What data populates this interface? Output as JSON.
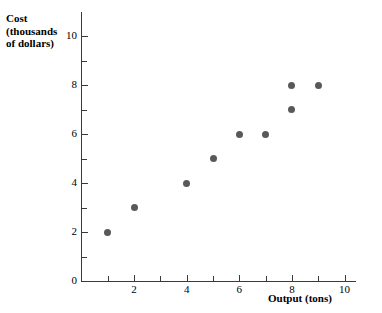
{
  "chart_data": {
    "type": "scatter",
    "title": "",
    "ylabel_lines": [
      "Cost",
      "(thousands",
      "of dollars)"
    ],
    "ylabel": "Cost (thousands of dollars)",
    "xlabel": "Output (tons)",
    "xlim": [
      0,
      10.45
    ],
    "ylim": [
      0,
      11
    ],
    "grid": false,
    "legend": null,
    "x_major_ticks": [
      0,
      2,
      4,
      6,
      8,
      10
    ],
    "x_minor_ticks": [
      1,
      3,
      5,
      7,
      9
    ],
    "x_tick_labels": [
      "0",
      "2",
      "4",
      "6",
      "8",
      "10"
    ],
    "y_major_ticks": [
      0,
      2,
      4,
      6,
      8,
      10
    ],
    "y_minor_ticks": [
      1,
      3,
      5,
      7,
      9
    ],
    "y_tick_labels": [
      "0",
      "2",
      "4",
      "6",
      "8",
      "10"
    ],
    "marker_color": "#595959",
    "axis_color": "#3a3a3a",
    "points": [
      {
        "x": 1,
        "y": 2
      },
      {
        "x": 2,
        "y": 3
      },
      {
        "x": 4,
        "y": 4
      },
      {
        "x": 5,
        "y": 5
      },
      {
        "x": 6,
        "y": 6
      },
      {
        "x": 7,
        "y": 6
      },
      {
        "x": 8,
        "y": 7
      },
      {
        "x": 8,
        "y": 8
      },
      {
        "x": 9,
        "y": 8
      }
    ]
  }
}
